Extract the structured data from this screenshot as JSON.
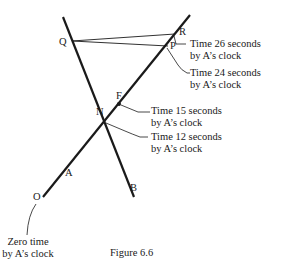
{
  "figure": {
    "caption": "Figure 6.6",
    "points": {
      "Q": "Q",
      "R": "R",
      "P": "P",
      "F": "F",
      "N": "N",
      "O": "O",
      "A": "A",
      "B": "B"
    },
    "annotations": [
      {
        "line1": "Time 26 seconds",
        "line2": "by A’s clock",
        "point": "R"
      },
      {
        "line1": "Time 24 seconds",
        "line2": "by A’s clock",
        "point": "P"
      },
      {
        "line1": "Time 15 seconds",
        "line2": "by A’s clock",
        "point": "F"
      },
      {
        "line1": "Time 12 seconds",
        "line2": "by A’s clock",
        "point": "N"
      },
      {
        "line1": "Zero time",
        "line2": "by A’s clock",
        "point": "O"
      }
    ],
    "colors": {
      "ink": "#1a1a1a",
      "background": "#ffffff"
    }
  }
}
